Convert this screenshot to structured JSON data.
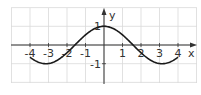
{
  "chart_data": {
    "type": "line",
    "title": "",
    "xlabel": "x",
    "ylabel": "y",
    "function": "y = cos(x)",
    "xlim": [
      -5,
      5
    ],
    "ylim": [
      -2,
      2
    ],
    "x_ticks": [
      -4,
      -3,
      -2,
      -1,
      1,
      2,
      3,
      4
    ],
    "x_tick_labels": [
      "-4",
      "-3",
      "-2",
      "-1",
      "1",
      "2",
      "3",
      "4"
    ],
    "y_ticks": [
      1,
      -1
    ],
    "y_tick_labels": [
      "1",
      "-1"
    ],
    "grid": true,
    "domain": [
      -4,
      4
    ],
    "series": [
      {
        "name": "cos(x)",
        "x": [
          -4,
          -3.5,
          -3,
          -2.5,
          -2,
          -1.5,
          -1,
          -0.5,
          0,
          0.5,
          1,
          1.5,
          2,
          2.5,
          3,
          3.5,
          4
        ],
        "values": [
          -0.65,
          -0.94,
          -0.99,
          -0.8,
          -0.42,
          0.07,
          0.54,
          0.88,
          1,
          0.88,
          0.54,
          0.07,
          -0.42,
          -0.8,
          -0.99,
          -0.94,
          -0.65
        ]
      }
    ]
  },
  "colors": {
    "grid": "#d9d9d9",
    "axis": "#333333",
    "curve": "#1a1a1a"
  }
}
